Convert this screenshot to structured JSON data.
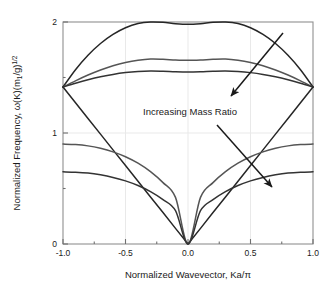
{
  "figure": {
    "background": "#ffffff",
    "plot_border_color": "#888888",
    "grid_color": "#e8e8e8"
  },
  "axis": {
    "y_title_part1": "Normalized Frequency, ",
    "y_title_omega": "ω",
    "y_title_part2": "(K)(m",
    "y_title_sub": "1",
    "y_title_part3": "/g)",
    "y_title_sup": "1/2",
    "x_title": "Normalized Wavevector, Ka/π",
    "x_ticks": [
      "-1.0",
      "-0.5",
      "0.0",
      "0.5",
      "1.0"
    ],
    "y_ticks": [
      "0",
      "1",
      "2"
    ]
  },
  "annotations": {
    "mass_ratio_label": "Increasing Mass Ratio",
    "arrow_upper_name": "upper-trend-arrow",
    "arrow_lower_name": "lower-trend-arrow"
  },
  "chart_data": {
    "type": "line",
    "title": "",
    "xlabel": "Normalized Wavevector, Ka/π",
    "ylabel": "Normalized Frequency, ω(K)(m1/g)^1/2",
    "xlim": [
      -1.0,
      1.0
    ],
    "ylim": [
      0.0,
      2.0
    ],
    "xticks": [
      -1.0,
      -0.5,
      0.0,
      0.5,
      1.0
    ],
    "yticks": [
      0,
      1,
      2
    ],
    "grid": true,
    "legend": "none",
    "annotations": [
      {
        "text": "Increasing Mass Ratio",
        "x": 0.05,
        "y": 1.22
      }
    ],
    "x": [
      -1.0,
      -0.9,
      -0.8,
      -0.7,
      -0.6,
      -0.5,
      -0.4,
      -0.3,
      -0.2,
      -0.1,
      0.0,
      0.1,
      0.2,
      0.3,
      0.4,
      0.5,
      0.6,
      0.7,
      0.8,
      0.9,
      1.0
    ],
    "series": [
      {
        "name": "optical-branch-high-mass-ratio",
        "branch": "optical",
        "color": "#262626",
        "values": [
          1.414,
          1.57,
          1.7,
          1.806,
          1.888,
          1.948,
          1.986,
          2.0,
          1.997,
          1.985,
          1.979,
          1.985,
          1.997,
          2.0,
          1.986,
          1.948,
          1.888,
          1.806,
          1.7,
          1.57,
          1.414
        ]
      },
      {
        "name": "optical-branch-mid-mass-ratio",
        "branch": "optical",
        "color": "#555555",
        "values": [
          1.414,
          1.47,
          1.522,
          1.568,
          1.606,
          1.635,
          1.655,
          1.666,
          1.664,
          1.658,
          1.655,
          1.658,
          1.664,
          1.666,
          1.655,
          1.635,
          1.606,
          1.568,
          1.522,
          1.47,
          1.414
        ]
      },
      {
        "name": "optical-branch-low-mass-ratio",
        "branch": "optical",
        "color": "#333333",
        "values": [
          1.414,
          1.448,
          1.479,
          1.506,
          1.528,
          1.544,
          1.554,
          1.558,
          1.556,
          1.552,
          1.55,
          1.552,
          1.556,
          1.558,
          1.554,
          1.544,
          1.528,
          1.506,
          1.479,
          1.448,
          1.414
        ]
      },
      {
        "name": "acoustic-branch-high-mass-ratio",
        "branch": "acoustic",
        "color": "#262626",
        "values": [
          1.414,
          1.273,
          1.131,
          0.99,
          0.848,
          0.707,
          0.566,
          0.424,
          0.283,
          0.141,
          0.0,
          0.141,
          0.283,
          0.424,
          0.566,
          0.707,
          0.848,
          0.99,
          1.131,
          1.273,
          1.414
        ]
      },
      {
        "name": "acoustic-branch-mid-mass-ratio",
        "branch": "acoustic",
        "color": "#555555",
        "values": [
          0.9,
          0.896,
          0.884,
          0.862,
          0.83,
          0.786,
          0.728,
          0.652,
          0.553,
          0.42,
          0.0,
          0.42,
          0.553,
          0.652,
          0.728,
          0.786,
          0.83,
          0.862,
          0.884,
          0.896,
          0.9
        ]
      },
      {
        "name": "acoustic-branch-low-mass-ratio",
        "branch": "acoustic",
        "color": "#333333",
        "values": [
          0.65,
          0.647,
          0.639,
          0.623,
          0.6,
          0.569,
          0.527,
          0.472,
          0.4,
          0.3,
          0.0,
          0.3,
          0.4,
          0.472,
          0.527,
          0.569,
          0.6,
          0.623,
          0.639,
          0.647,
          0.65
        ]
      }
    ]
  }
}
